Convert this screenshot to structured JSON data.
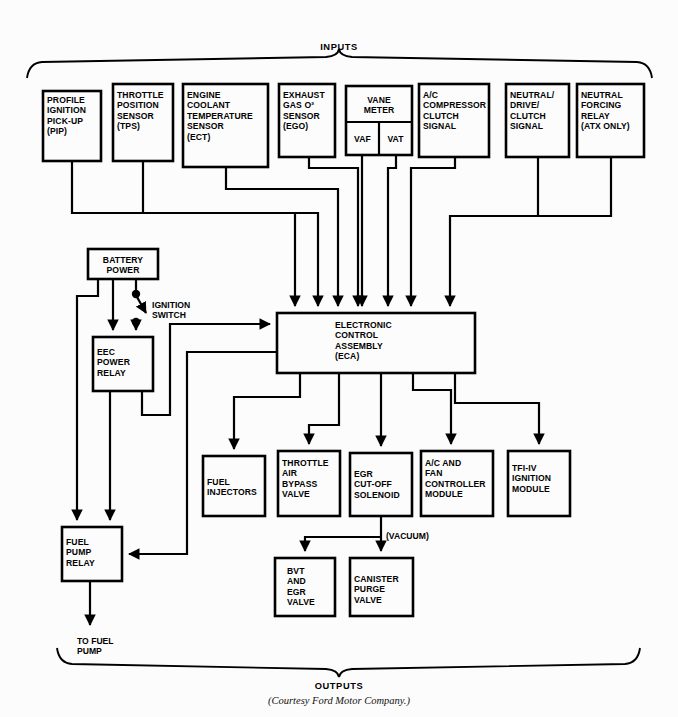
{
  "figure": {
    "inputs_brace_label": "INPUTS",
    "outputs_brace_label": "OUTPUTS",
    "courtesy": "(Courtesy Ford Motor Company.)"
  },
  "inputs": [
    {
      "id": "pip",
      "label": "PROFILE\nIGNITION\nPICK-UP\n(PIP)"
    },
    {
      "id": "tps",
      "label": "THROTTLE\nPOSITION\nSENSOR\n(TPS)"
    },
    {
      "id": "ect",
      "label": "ENGINE\nCOOLANT\nTEMPERATURE\nSENSOR\n(ECT)"
    },
    {
      "id": "ego",
      "label": "EXHAUST\nGAS O²\nSENSOR\n(EGO)"
    },
    {
      "id": "vane-meter",
      "label": "VANE\nMETER",
      "sub_left": "VAF",
      "sub_right": "VAT"
    },
    {
      "id": "ac-clutch",
      "label": "A/C\nCOMPRESSOR\nCLUTCH\nSIGNAL"
    },
    {
      "id": "ndc",
      "label": "NEUTRAL/\nDRIVE/\nCLUTCH\nSIGNAL"
    },
    {
      "id": "nfr",
      "label": "NEUTRAL\nFORCING\nRELAY\n(ATX ONLY)"
    }
  ],
  "power": {
    "battery": "BATTERY\nPOWER",
    "ignition_switch": "IGNITION\nSWITCH",
    "eec_power_relay": "EEC\nPOWER\nRELAY",
    "fuel_pump_relay": "FUEL\nPUMP\nRELAY",
    "to_fuel_pump": "TO FUEL\nPUMP"
  },
  "controller": {
    "eca": "ELECTRONIC\nCONTROL\nASSEMBLY\n(ECA)"
  },
  "outputs": [
    {
      "id": "fuel-injectors",
      "label": "FUEL\nINJECTORS"
    },
    {
      "id": "throttle-air-bypass",
      "label": "THROTTLE\nAIR\nBYPASS\nVALVE"
    },
    {
      "id": "egr-cut-off",
      "label": "EGR\nCUT-OFF\nSOLENOID"
    },
    {
      "id": "ac-fan-controller",
      "label": "A/C AND\nFAN\nCONTROLLER\nMODULE"
    },
    {
      "id": "tfi-iv",
      "label": "TFI-IV\nIGNITION\nMODULE"
    }
  ],
  "vacuum_outputs": [
    {
      "id": "bvt-egr-valve",
      "label": "BVT\nAND\nEGR\nVALVE"
    },
    {
      "id": "canister-purge",
      "label": "CANISTER\nPURGE\nVALVE"
    }
  ],
  "annotations": {
    "vacuum": "(VACUUM)"
  },
  "colors": {
    "ink": "#000000",
    "paper": "#fcfcfc"
  }
}
